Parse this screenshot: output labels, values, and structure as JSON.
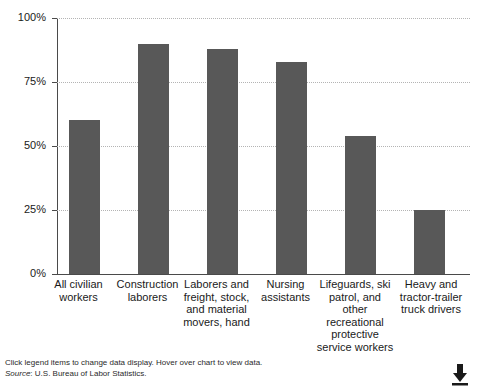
{
  "chart_data": {
    "type": "bar",
    "title": "",
    "subtitle": "",
    "xlabel": "",
    "ylabel": "",
    "ylim": [
      0,
      100
    ],
    "grid": true,
    "legend_position": "none",
    "categories": [
      "All civilian workers",
      "Construction laborers",
      "Laborers and freight, stock, and material movers, hand",
      "Nursing assistants",
      "Lifeguards, ski patrol, and other recreational protective service workers",
      "Heavy and tractor-trailer truck drivers"
    ],
    "category_lines": [
      [
        "All civilian",
        "workers"
      ],
      [
        "Construction",
        "laborers"
      ],
      [
        "Laborers and",
        "freight, stock,",
        "and material",
        "movers, hand"
      ],
      [
        "Nursing",
        "assistants"
      ],
      [
        "Lifeguards, ski",
        "patrol, and",
        "other",
        "recreational",
        "protective",
        "service workers"
      ],
      [
        "Heavy and",
        "tractor-trailer",
        "truck drivers"
      ]
    ],
    "values": [
      60,
      90,
      88,
      83,
      54,
      25
    ],
    "yticks": [
      0,
      25,
      50,
      75,
      100
    ],
    "ytick_labels": [
      "0%",
      "25%",
      "50%",
      "75%",
      "100%"
    ],
    "bar_color": "#585858",
    "gridline_color": "#b4b4b4",
    "axis_color": "#4a4a4a"
  },
  "footer": {
    "hint": "Click legend items to change data display. Hover over chart to view data.",
    "source_label": "Source",
    "source_text": ": U.S. Bureau of Labor Statistics.",
    "download_icon": "download-icon"
  }
}
